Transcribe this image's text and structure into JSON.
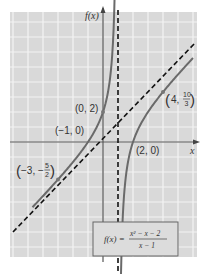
{
  "chart_data": {
    "type": "line",
    "title": "",
    "xlabel": "x",
    "ylabel": "f(x)",
    "function": "f(x) = (x^2 - x - 2)/(x - 1)",
    "formula_box": {
      "lhs": "f(x) =",
      "numerator": "x² − x − 2",
      "denominator": "x − 1"
    },
    "xlim": [
      -6.2,
      6.2
    ],
    "ylim": [
      -7.7,
      8.7
    ],
    "grid": true,
    "asymptotes": [
      {
        "type": "vertical",
        "equation": "x = 1",
        "style": "dashed"
      },
      {
        "type": "slant",
        "equation": "y = x",
        "style": "dashed"
      }
    ],
    "series": [
      {
        "name": "left branch",
        "x_range": [
          -4.7,
          0.8
        ]
      },
      {
        "name": "right branch",
        "x_range": [
          1.2,
          6
        ]
      }
    ],
    "points": [
      {
        "x": 0,
        "y": 2,
        "label": "(0, 2)"
      },
      {
        "x": -1,
        "y": 0,
        "label": "(−1, 0)"
      },
      {
        "x": 2,
        "y": 0,
        "label": "(2, 0)"
      },
      {
        "x": 4,
        "y": 3.3333,
        "label": "(4, 10/3)",
        "label_main": "4,",
        "frac_num": "10",
        "frac_den": "3"
      },
      {
        "x": -3,
        "y": -2.5,
        "label": "(−3, −5/2)",
        "label_main": "−3, −",
        "frac_num": "5",
        "frac_den": "2"
      }
    ]
  },
  "labels": {
    "y_axis": "f(x)",
    "x_axis": "x",
    "p02": "(0, 2)",
    "pm10": "(−1, 0)",
    "p20": "(2, 0)"
  }
}
